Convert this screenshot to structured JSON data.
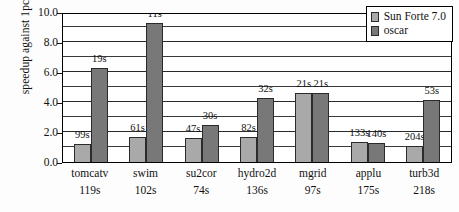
{
  "chart_data": {
    "type": "bar",
    "title": "",
    "xlabel": "",
    "ylabel": "speedup against 1pc",
    "ylim": [
      0.0,
      10.0
    ],
    "ytick_labels": [
      "0.0",
      "2.0",
      "4.0",
      "6.0",
      "8.0",
      "10.0"
    ],
    "ytick_values": [
      0.0,
      2.0,
      4.0,
      6.0,
      8.0,
      10.0
    ],
    "gridline_interval": 1.0,
    "grid": true,
    "legend_position": "top-right",
    "categories": [
      "tomcatv",
      "swim",
      "su2cor",
      "hydro2d",
      "mgrid",
      "applu",
      "turb3d"
    ],
    "category_baselines": [
      "119s",
      "102s",
      "74s",
      "136s",
      "97s",
      "175s",
      "218s"
    ],
    "series": [
      {
        "name": "Sun Forte 7.0",
        "color": "#a9a9a9",
        "values": [
          1.2,
          1.67,
          1.57,
          1.66,
          4.62,
          1.32,
          1.07
        ],
        "point_labels": [
          "99s",
          "61s",
          "47s",
          "82s",
          "21s",
          "133s",
          "204s"
        ]
      },
      {
        "name": "oscar",
        "color": "#787878",
        "values": [
          6.26,
          9.27,
          2.47,
          4.25,
          4.62,
          1.25,
          4.11
        ],
        "point_labels": [
          "19s",
          "11s",
          "30s",
          "32s",
          "21s",
          "140s",
          "53s"
        ]
      }
    ]
  },
  "legend": {
    "items": [
      {
        "label": "Sun Forte 7.0",
        "color": "#a9a9a9"
      },
      {
        "label": "oscar",
        "color": "#787878"
      }
    ]
  }
}
